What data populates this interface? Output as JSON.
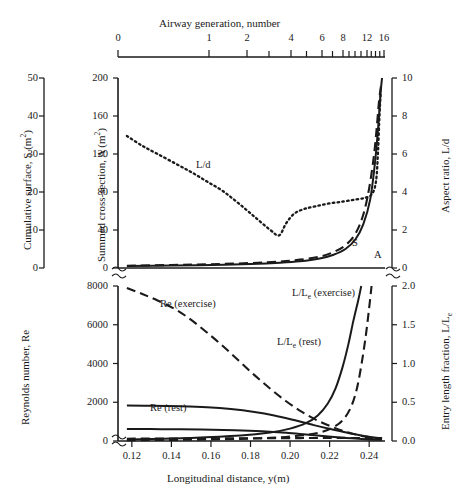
{
  "chart_data": {
    "type": "line",
    "title": "",
    "figure_note": "Two stacked panels sharing a longitudinal-distance x-axis with a secondary non-linear airway-generation axis on top.",
    "x_axis_bottom": {
      "label": "Longitudinal distance, y(m)",
      "ticks": [
        "0.12",
        "0.14",
        "0.16",
        "0.18",
        "0.20",
        "0.22",
        "0.24"
      ],
      "values": [
        0.12,
        0.14,
        0.16,
        0.18,
        0.2,
        0.22,
        0.24
      ],
      "range": [
        0.113,
        0.248
      ],
      "break_marker": true
    },
    "x_axis_top": {
      "label": "Airway generation, number",
      "ticks": [
        "0",
        "1",
        "2",
        "4",
        "6",
        "8",
        "12",
        "16"
      ],
      "values": [
        0,
        1,
        2,
        4,
        6,
        8,
        12,
        16
      ],
      "minor_values": [
        3,
        5,
        7,
        9,
        10,
        11,
        13,
        14,
        15
      ],
      "scale": "non-linear (compresses toward 16)"
    },
    "panels": [
      {
        "name": "upper",
        "y_axis_outer": {
          "label": "Cumulative surface, S (m2)",
          "label_html": "Cumulative surface, S (m<sup>2</sup>)",
          "ticks": [
            "0",
            "10",
            "20",
            "30",
            "40",
            "50"
          ],
          "values": [
            0,
            10,
            20,
            30,
            40,
            50
          ],
          "range": [
            0,
            50
          ]
        },
        "y_axis_inner": {
          "label": "Summed cross-section, A (m2)",
          "label_html": "Summed cross-section, A (m<sup>2</sup>)",
          "ticks": [
            "0",
            "40",
            "80",
            "120",
            "160",
            "200"
          ],
          "values": [
            0,
            40,
            80,
            120,
            160,
            200
          ],
          "range": [
            0,
            200
          ]
        },
        "y_axis_right": {
          "label": "Aspect ratio, L/d",
          "ticks": [
            "0",
            "2",
            "4",
            "6",
            "8",
            "10"
          ],
          "values": [
            0,
            2,
            4,
            6,
            8,
            10
          ],
          "range": [
            0,
            10
          ]
        },
        "series": [
          {
            "name": "L/d",
            "label": "L/d",
            "style": "dotted",
            "axis": "right",
            "points": [
              [
                0.1175,
                6.95
              ],
              [
                0.125,
                6.45
              ],
              [
                0.133,
                6.0
              ],
              [
                0.142,
                5.5
              ],
              [
                0.15,
                5.05
              ],
              [
                0.158,
                4.55
              ],
              [
                0.166,
                4.05
              ],
              [
                0.174,
                3.4
              ],
              [
                0.182,
                2.7
              ],
              [
                0.19,
                2.0
              ],
              [
                0.1945,
                1.72
              ],
              [
                0.198,
                2.35
              ],
              [
                0.202,
                2.85
              ],
              [
                0.207,
                3.1
              ],
              [
                0.213,
                3.25
              ],
              [
                0.22,
                3.4
              ],
              [
                0.227,
                3.5
              ],
              [
                0.233,
                3.6
              ],
              [
                0.238,
                3.7
              ],
              [
                0.2415,
                3.9
              ],
              [
                0.2435,
                4.6
              ],
              [
                0.2445,
                6.2
              ],
              [
                0.2452,
                8.0
              ],
              [
                0.2458,
                9.2
              ]
            ]
          },
          {
            "name": "S",
            "label": "S",
            "style": "dashed",
            "axis": "left-outer",
            "points": [
              [
                0.1175,
                0.6
              ],
              [
                0.14,
                0.8
              ],
              [
                0.16,
                1.0
              ],
              [
                0.18,
                1.3
              ],
              [
                0.195,
                1.7
              ],
              [
                0.205,
                2.2
              ],
              [
                0.215,
                3.0
              ],
              [
                0.222,
                4.2
              ],
              [
                0.228,
                6.0
              ],
              [
                0.233,
                9.0
              ],
              [
                0.237,
                14.0
              ],
              [
                0.24,
                21.0
              ],
              [
                0.2425,
                30.0
              ],
              [
                0.244,
                38.0
              ],
              [
                0.245,
                44.0
              ],
              [
                0.246,
                48.0
              ]
            ]
          },
          {
            "name": "A",
            "label": "A",
            "style": "solid",
            "axis": "left-inner",
            "points": [
              [
                0.1175,
                2.0
              ],
              [
                0.14,
                2.6
              ],
              [
                0.16,
                3.2
              ],
              [
                0.18,
                4.2
              ],
              [
                0.195,
                5.5
              ],
              [
                0.205,
                7.0
              ],
              [
                0.215,
                10.0
              ],
              [
                0.222,
                14.0
              ],
              [
                0.228,
                20.0
              ],
              [
                0.233,
                30.0
              ],
              [
                0.237,
                46.0
              ],
              [
                0.2405,
                72.0
              ],
              [
                0.243,
                112.0
              ],
              [
                0.2448,
                155.0
              ],
              [
                0.2458,
                185.0
              ],
              [
                0.2465,
                200.0
              ]
            ]
          }
        ]
      },
      {
        "name": "lower",
        "y_axis_left": {
          "label": "Reynolds number, Re",
          "ticks": [
            "0",
            "2000",
            "4000",
            "6000",
            "8000"
          ],
          "values": [
            0,
            2000,
            4000,
            6000,
            8000
          ],
          "range": [
            0,
            8000
          ]
        },
        "y_axis_right": {
          "label": "Entry length fraction, L/Le",
          "label_html": "Entry length fraction, L/L<sub>e</sub>",
          "ticks": [
            "0.0",
            "0.5",
            "1.0",
            "1.5",
            "2.0"
          ],
          "values": [
            0.0,
            0.5,
            1.0,
            1.5,
            2.0
          ],
          "range": [
            0.0,
            2.0
          ]
        },
        "series": [
          {
            "name": "Re (exercise)",
            "label": "Re (exercise)",
            "style": "dashed",
            "axis": "left",
            "points": [
              [
                0.1175,
                7900
              ],
              [
                0.125,
                7600
              ],
              [
                0.133,
                7250
              ],
              [
                0.142,
                6800
              ],
              [
                0.15,
                6250
              ],
              [
                0.158,
                5600
              ],
              [
                0.166,
                4900
              ],
              [
                0.174,
                4150
              ],
              [
                0.182,
                3400
              ],
              [
                0.19,
                2700
              ],
              [
                0.198,
                2050
              ],
              [
                0.206,
                1500
              ],
              [
                0.214,
                1050
              ],
              [
                0.222,
                700
              ],
              [
                0.23,
                420
              ],
              [
                0.238,
                230
              ],
              [
                0.2465,
                110
              ]
            ]
          },
          {
            "name": "Re (rest)",
            "label": "Re (rest)",
            "style": "solid",
            "axis": "left",
            "points": [
              [
                0.1175,
                1830
              ],
              [
                0.13,
                1820
              ],
              [
                0.145,
                1790
              ],
              [
                0.158,
                1740
              ],
              [
                0.17,
                1650
              ],
              [
                0.182,
                1500
              ],
              [
                0.192,
                1320
              ],
              [
                0.202,
                1080
              ],
              [
                0.212,
                820
              ],
              [
                0.222,
                580
              ],
              [
                0.23,
                400
              ],
              [
                0.238,
                250
              ],
              [
                0.2465,
                130
              ]
            ]
          },
          {
            "name": "lower-solid",
            "label": "",
            "style": "solid",
            "axis": "left",
            "points": [
              [
                0.1175,
                620
              ],
              [
                0.135,
                610
              ],
              [
                0.155,
                590
              ],
              [
                0.172,
                555
              ],
              [
                0.186,
                500
              ],
              [
                0.198,
                420
              ],
              [
                0.208,
                330
              ],
              [
                0.218,
                240
              ],
              [
                0.228,
                160
              ],
              [
                0.238,
                95
              ],
              [
                0.2465,
                55
              ]
            ]
          },
          {
            "name": "L/Le (rest)",
            "label": "L/Le (rest)",
            "label_html": "L/L<sub>e</sub> (rest)",
            "style": "solid",
            "axis": "right",
            "points": [
              [
                0.1175,
                0.02
              ],
              [
                0.15,
                0.04
              ],
              [
                0.175,
                0.07
              ],
              [
                0.19,
                0.11
              ],
              [
                0.2,
                0.16
              ],
              [
                0.208,
                0.23
              ],
              [
                0.214,
                0.33
              ],
              [
                0.219,
                0.48
              ],
              [
                0.223,
                0.68
              ],
              [
                0.2265,
                0.95
              ],
              [
                0.2295,
                1.25
              ],
              [
                0.232,
                1.55
              ],
              [
                0.2345,
                1.82
              ],
              [
                0.236,
                2.0
              ]
            ]
          },
          {
            "name": "L/Le (exercise)",
            "label": "L/Le (exercise)",
            "label_html": "L/L<sub>e</sub> (exercise)",
            "style": "dashed",
            "axis": "right",
            "points": [
              [
                0.1175,
                0.01
              ],
              [
                0.16,
                0.02
              ],
              [
                0.19,
                0.04
              ],
              [
                0.205,
                0.07
              ],
              [
                0.215,
                0.11
              ],
              [
                0.222,
                0.18
              ],
              [
                0.227,
                0.28
              ],
              [
                0.231,
                0.45
              ],
              [
                0.234,
                0.7
              ],
              [
                0.2365,
                1.05
              ],
              [
                0.2385,
                1.4
              ],
              [
                0.24,
                1.72
              ],
              [
                0.2412,
                2.0
              ]
            ]
          },
          {
            "name": "baseline-dashed",
            "label": "",
            "style": "dashed",
            "axis": "left",
            "points": [
              [
                0.1175,
                120
              ],
              [
                0.15,
                130
              ],
              [
                0.18,
                140
              ],
              [
                0.205,
                150
              ],
              [
                0.225,
                160
              ],
              [
                0.2465,
                150
              ]
            ]
          }
        ]
      }
    ],
    "grid": false,
    "legend": "inline curve annotations"
  },
  "style": {
    "ink": "#1a1a1a",
    "background": "#ffffff"
  }
}
